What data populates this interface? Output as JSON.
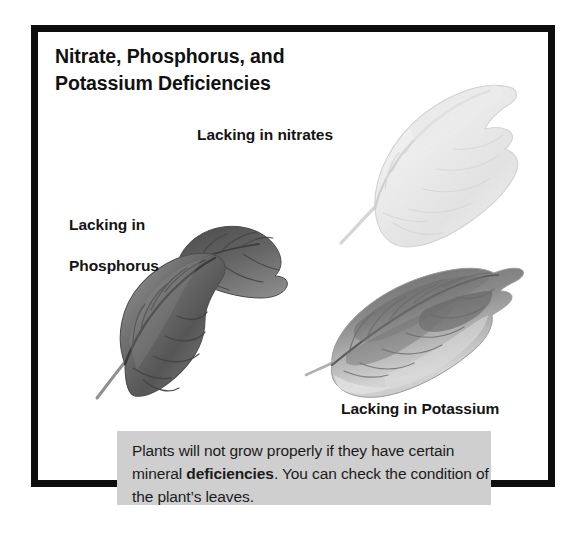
{
  "figure": {
    "title_line1": "Nitrate, Phosphorus, and",
    "title_line2": "Potassium Deficiencies",
    "frame_color": "#0d0d0d",
    "background_color": "#ffffff"
  },
  "labels": {
    "nitrates": "Lacking in nitrates",
    "phosphorus_line1": "Lacking in",
    "phosphorus_line2": "Phosphorus",
    "potassium": "Lacking in Potassium"
  },
  "leaves": [
    {
      "name": "nitrate-deficient-leaf",
      "label": "Lacking in nitrates",
      "appearance": "very pale, washed-out whitish-grey leaf with faint veins"
    },
    {
      "name": "phosphorus-deficient-leaf",
      "label": "Lacking in Phosphorus",
      "appearance": "dark grey, deeply shaded leaves with pronounced dark veins"
    },
    {
      "name": "potassium-deficient-leaf",
      "label": "Lacking in Potassium",
      "appearance": "mottled leaf with dark blotches and pale bleached margins"
    }
  ],
  "caption": {
    "part1": "Plants will not grow properly if they have certain mineral ",
    "emphasis": "deficiencies",
    "part2": ". You can check the condition of the plant’s leaves.",
    "background_color": "#cfcfcf"
  }
}
